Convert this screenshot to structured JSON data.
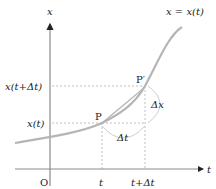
{
  "diagram": {
    "title": "x = x(t)",
    "axes": {
      "x_axis_label": "t",
      "y_axis_label": "x",
      "origin_label": "O"
    },
    "ticks": {
      "t": "t",
      "t_plus_dt": "t+Δt",
      "x_t": "x(t)",
      "x_t_plus_dt": "x(t+Δt)"
    },
    "points": {
      "p": "P",
      "p_prime": "P′"
    },
    "increments": {
      "delta_t": "Δt",
      "delta_x": "Δx"
    },
    "colors": {
      "curve": "#b5b5b5",
      "axis": "#8a8a8a",
      "dashed": "#c0c0c0",
      "text": "#222222"
    }
  }
}
